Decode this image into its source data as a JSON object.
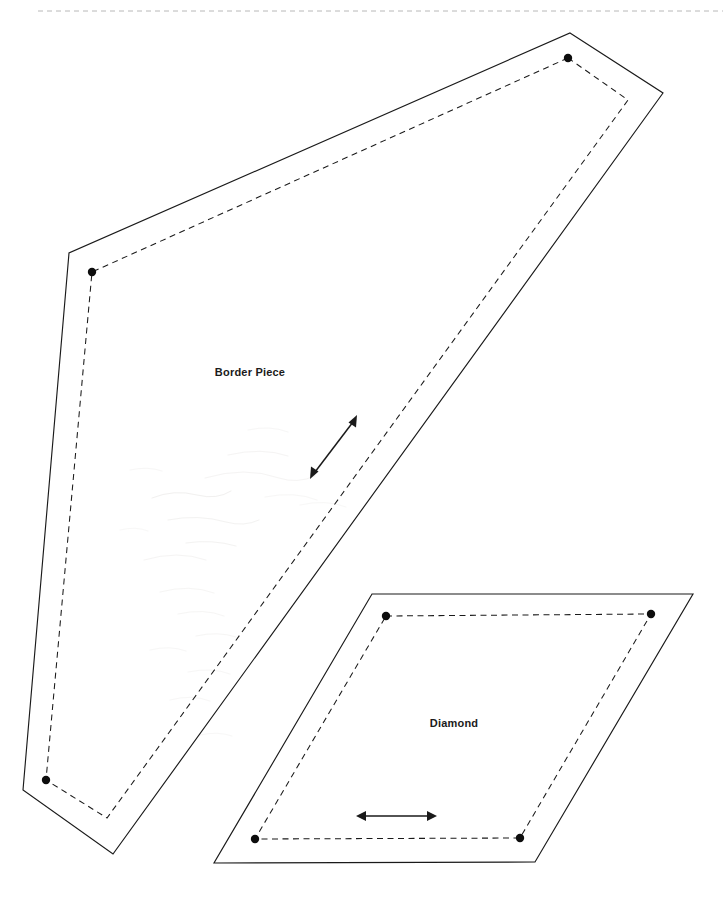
{
  "document": {
    "type": "sewing-pattern-template-sheet",
    "background_color": "#ffffff",
    "width": 723,
    "height": 898,
    "header_rule": {
      "label": "page-top-dashed-rule",
      "color": "#b8b8b8",
      "y": 11,
      "x_start": 38,
      "x_end": 723
    },
    "faint_header_mark": {
      "text": "",
      "color": "#d9d9d9",
      "x": 636,
      "y": 7
    }
  },
  "pieces": [
    {
      "id": "border-piece",
      "label": "Border Piece",
      "label_x": 250,
      "label_y": 376,
      "cut_line_color": "#1a1a1a",
      "seam_line_color": "#1a1a1a",
      "cut_path": "M 570 33 L 663 93 L 113 854 L 23 790 L 69 253 Z",
      "seam_path": "M 568 58 L 628 100 L 107 818 L 46 780 L 92 272 Z",
      "corner_dots": [
        {
          "name": "seam-dot-top",
          "x": 568,
          "y": 58
        },
        {
          "name": "seam-dot-left",
          "x": 92,
          "y": 272
        },
        {
          "name": "seam-dot-bottom-left",
          "x": 46,
          "y": 780
        }
      ],
      "grain_arrow": {
        "name": "grain-line-arrow",
        "x1": 311,
        "y1": 477,
        "x2": 357,
        "y2": 417,
        "double_headed": true
      }
    },
    {
      "id": "diamond-piece",
      "label": "Diamond",
      "label_x": 454,
      "label_y": 727,
      "cut_line_color": "#1a1a1a",
      "seam_line_color": "#1a1a1a",
      "cut_path": "M 372 594 L 693 594 L 535 862 L 214 863 Z",
      "seam_path": "M 386 616 L 651 614 L 520 838 L 255 839 Z",
      "corner_dots": [
        {
          "name": "seam-dot-top-left",
          "x": 386,
          "y": 616
        },
        {
          "name": "seam-dot-top-right",
          "x": 651,
          "y": 614
        },
        {
          "name": "seam-dot-bottom-right",
          "x": 520,
          "y": 838
        },
        {
          "name": "seam-dot-bottom-left",
          "x": 255,
          "y": 839
        }
      ],
      "grain_arrow": {
        "name": "grain-line-arrow",
        "x1": 358,
        "y1": 816,
        "x2": 435,
        "y2": 816,
        "double_headed": true
      }
    }
  ],
  "legend": {
    "cut_line_style": "solid",
    "seam_line_style": "dashed",
    "dot_meaning": "seam-allowance-corner-point",
    "arrow_meaning": "grain-line"
  }
}
